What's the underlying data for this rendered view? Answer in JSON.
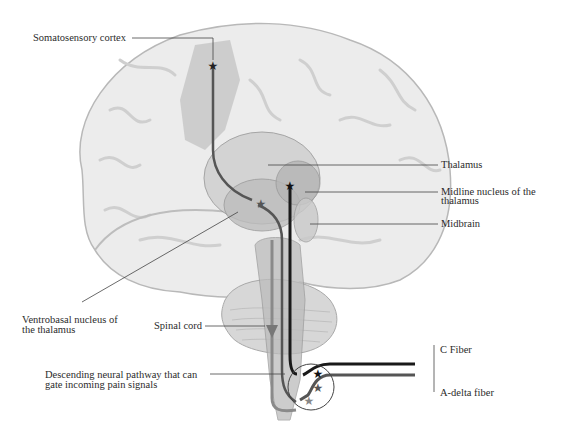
{
  "figure": {
    "labels": {
      "somatosensory_cortex": "Somatosensory cortex",
      "thalamus": "Thalamus",
      "midline_nucleus_line1": "Midline nucleus of the",
      "midline_nucleus_line2": "thalamus",
      "midbrain": "Midbrain",
      "ventrobasal_line1": "Ventrobasal nucleus of",
      "ventrobasal_line2": "the thalamus",
      "spinal_cord": "Spinal cord",
      "descending_line1": "Descending neural pathway that can",
      "descending_line2": "gate incoming pain signals",
      "c_fiber": "C Fiber",
      "a_delta_fiber": "A-delta fiber"
    },
    "colors": {
      "brain_fill": "#ececec",
      "brain_stroke": "#b8b8b8",
      "thalamus_fill": "#c9c9c9",
      "c_fiber_path": "#1a1a1a",
      "a_delta_path": "#555555",
      "descending_path": "#8a8a8a",
      "leader_line": "#444444"
    }
  }
}
